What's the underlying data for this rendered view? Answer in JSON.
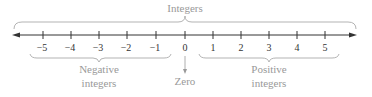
{
  "diagram": {
    "type": "number-line",
    "title": "Integers",
    "ticks": [
      {
        "value": -5,
        "label": "−5",
        "x": 43
      },
      {
        "value": -4,
        "label": "−4",
        "x": 71
      },
      {
        "value": -3,
        "label": "−3",
        "x": 99
      },
      {
        "value": -2,
        "label": "−2",
        "x": 127
      },
      {
        "value": -1,
        "label": "−1",
        "x": 156
      },
      {
        "value": 0,
        "label": "0",
        "x": 185
      },
      {
        "value": 1,
        "label": "1",
        "x": 213
      },
      {
        "value": 2,
        "label": "2",
        "x": 241
      },
      {
        "value": 3,
        "label": "3",
        "x": 269
      },
      {
        "value": 4,
        "label": "4",
        "x": 297
      },
      {
        "value": 5,
        "label": "5",
        "x": 325
      }
    ],
    "braces": {
      "integers": {
        "label": "Integers"
      },
      "negative": {
        "line1": "Negative",
        "line2": "integers"
      },
      "positive": {
        "line1": "Positive",
        "line2": "integers"
      }
    },
    "zero_label": "Zero",
    "colors": {
      "axis": "#333333",
      "brace": "#aaaaaa",
      "label": "#999999"
    }
  }
}
